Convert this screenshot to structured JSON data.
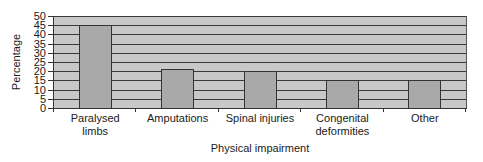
{
  "chart_data": {
    "type": "bar",
    "title": "",
    "xlabel": "Physical impairment",
    "ylabel": "Percentage",
    "categories": [
      "Paralysed limbs",
      "Amputations",
      "Spinal injuries",
      "Congenital deformities",
      "Other"
    ],
    "category_lines": [
      [
        "Paralysed",
        "limbs"
      ],
      [
        "Amputations"
      ],
      [
        "Spinal injuries"
      ],
      [
        "Congenital",
        "deformities"
      ],
      [
        "Other"
      ]
    ],
    "values": [
      45,
      21,
      20,
      15,
      15
    ],
    "ylim": [
      0,
      50
    ],
    "yticks": [
      0,
      5,
      10,
      15,
      20,
      25,
      30,
      35,
      40,
      45,
      50
    ],
    "grid": true,
    "legend": null,
    "colors": {
      "plot_bg": "#c8c8c8",
      "bar": "#a9a9a9",
      "grid": "#3a3a3a"
    }
  }
}
